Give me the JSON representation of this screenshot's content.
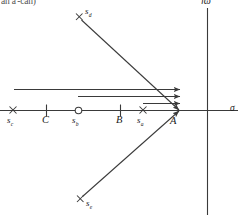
{
  "figure": {
    "kind": "s-plane-root-locus-diagram",
    "width": 241,
    "height": 215,
    "background_color": "#ffffff",
    "line_color": "#3a3a3a",
    "text_color": "#1a1a1a",
    "caption_fragment": "an a'-can)"
  },
  "axes": {
    "real_axis": {
      "name": "sigma-axis",
      "label": "σ",
      "y": 110,
      "x_start": 0,
      "x_end": 238
    },
    "imag_axis": {
      "name": "jomega-axis",
      "label": "jω",
      "x": 207,
      "y_start": 8,
      "y_end": 215
    }
  },
  "markers": [
    {
      "id": "sc",
      "kind": "pole",
      "glyph": "×",
      "label": "s",
      "subscript": "c",
      "x": 13,
      "y": 110
    },
    {
      "id": "C",
      "kind": "tick",
      "glyph": "|",
      "label": "C",
      "subscript": "",
      "x": 46,
      "y": 110
    },
    {
      "id": "sb",
      "kind": "zero",
      "glyph": "○",
      "label": "s",
      "subscript": "b",
      "x": 78,
      "y": 110
    },
    {
      "id": "B",
      "kind": "tick",
      "glyph": "|",
      "label": "B",
      "subscript": "",
      "x": 120,
      "y": 110
    },
    {
      "id": "sa",
      "kind": "pole",
      "glyph": "×",
      "label": "s",
      "subscript": "a",
      "x": 143,
      "y": 110
    },
    {
      "id": "A",
      "kind": "point",
      "glyph": "",
      "label": "A",
      "subscript": "",
      "x": 176,
      "y": 110
    },
    {
      "id": "sd",
      "kind": "pole",
      "glyph": "×",
      "label": "s",
      "subscript": "d",
      "x": 79,
      "y": 17
    },
    {
      "id": "se",
      "kind": "pole",
      "glyph": "×",
      "label": "s",
      "subscript": "e",
      "x": 80,
      "y": 199
    }
  ],
  "vectors": [
    {
      "id": "vec-from-sc",
      "name": "vector-sc-to-A",
      "x1": 14,
      "y1": 89,
      "x2": 180,
      "y2": 89,
      "arrow": true
    },
    {
      "id": "vec-from-sb",
      "name": "vector-sb-to-A",
      "x1": 78,
      "y1": 96,
      "x2": 180,
      "y2": 96,
      "arrow": true
    },
    {
      "id": "vec-from-sa",
      "name": "vector-sa-to-A",
      "x1": 143,
      "y1": 103,
      "x2": 180,
      "y2": 103,
      "arrow": true
    },
    {
      "id": "vec-from-sd",
      "name": "vector-sd-to-A",
      "x1": 81,
      "y1": 19,
      "x2": 178,
      "y2": 109,
      "arrow": true
    },
    {
      "id": "vec-from-se",
      "name": "vector-se-to-A",
      "x1": 82,
      "y1": 197,
      "x2": 178,
      "y2": 111,
      "arrow": true
    }
  ]
}
